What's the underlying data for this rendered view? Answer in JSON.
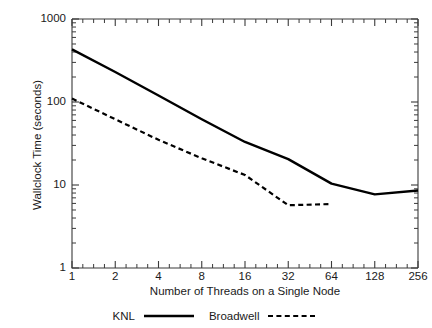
{
  "chart_data": {
    "type": "line",
    "title": "",
    "xlabel": "Number of Threads on a Single Node",
    "ylabel": "Wallclock Time (seconds)",
    "xscale": "log2",
    "yscale": "log10",
    "xlim": [
      1,
      256
    ],
    "ylim": [
      1,
      1000
    ],
    "grid": false,
    "legend_position": "bottom",
    "x_ticks": [
      "1",
      "2",
      "4",
      "8",
      "16",
      "32",
      "64",
      "128",
      "256"
    ],
    "x_tick_values": [
      1,
      2,
      4,
      8,
      16,
      32,
      64,
      128,
      256
    ],
    "y_ticks": [
      "1",
      "10",
      "100",
      "1000"
    ],
    "y_tick_values": [
      1,
      10,
      100,
      1000
    ],
    "x": [
      1,
      2,
      4,
      8,
      16,
      32,
      64,
      128,
      256
    ],
    "series": [
      {
        "name": "KNL",
        "style": "solid",
        "color": "#000000",
        "x": [
          1,
          2,
          4,
          8,
          16,
          32,
          64,
          128,
          256
        ],
        "values": [
          430,
          230,
          120,
          62,
          33,
          20.5,
          10.4,
          7.7,
          8.6
        ]
      },
      {
        "name": "Broadwell",
        "style": "dashed",
        "color": "#000000",
        "x": [
          1,
          2,
          4,
          8,
          16,
          32,
          64
        ],
        "values": [
          110,
          62,
          35,
          21,
          13.2,
          5.7,
          5.9
        ]
      }
    ]
  },
  "legend": {
    "entries": [
      {
        "label": "KNL",
        "style": "solid"
      },
      {
        "label": "Broadwell",
        "style": "dashed"
      }
    ]
  },
  "axes": {
    "x_title": "Number of Threads on a Single Node",
    "y_title": "Wallclock Time (seconds)"
  }
}
